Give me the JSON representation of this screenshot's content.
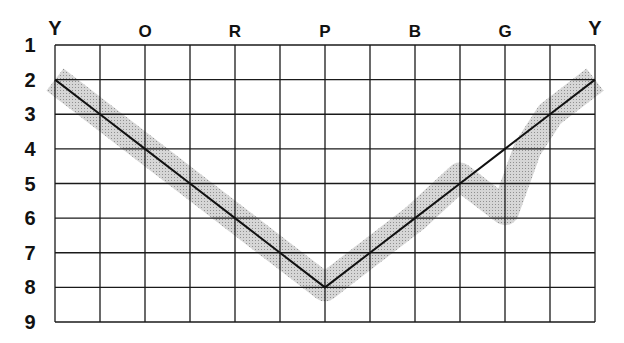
{
  "chart_data": {
    "type": "line",
    "title": "",
    "xlabel": "",
    "ylabel": "",
    "x_tick_labels": [
      {
        "col": 0,
        "label": "Y"
      },
      {
        "col": 2,
        "label": "O"
      },
      {
        "col": 4,
        "label": "R"
      },
      {
        "col": 6,
        "label": "P"
      },
      {
        "col": 8,
        "label": "B"
      },
      {
        "col": 10,
        "label": "G"
      },
      {
        "col": 12,
        "label": "Y"
      }
    ],
    "y_tick_labels": [
      "1",
      "2",
      "3",
      "4",
      "5",
      "6",
      "7",
      "8",
      "9"
    ],
    "x_range": [
      0,
      12
    ],
    "ylim": [
      1,
      9
    ],
    "y_inverted": true,
    "grid": true,
    "legend": null,
    "series": [
      {
        "name": "reference line",
        "style": "solid black line",
        "x": [
          0,
          1,
          2,
          3,
          4,
          5,
          6,
          7,
          8,
          9,
          10,
          11,
          12
        ],
        "values": [
          2,
          3,
          4,
          5,
          6,
          7,
          8,
          7,
          6,
          5,
          4,
          3,
          2
        ]
      },
      {
        "name": "shaded band",
        "style": "gray stippled band",
        "x": [
          0,
          1,
          2,
          3,
          4,
          5,
          6,
          7,
          8,
          9,
          10,
          10.5,
          11,
          12
        ],
        "values": [
          2,
          3,
          4,
          5,
          6,
          7,
          8,
          7,
          6,
          4.8,
          5.8,
          4,
          3,
          2
        ]
      }
    ]
  },
  "colors": {
    "grid": "#1a1a1a",
    "line": "#111111",
    "band": "#bdbdbd",
    "background": "#ffffff"
  }
}
